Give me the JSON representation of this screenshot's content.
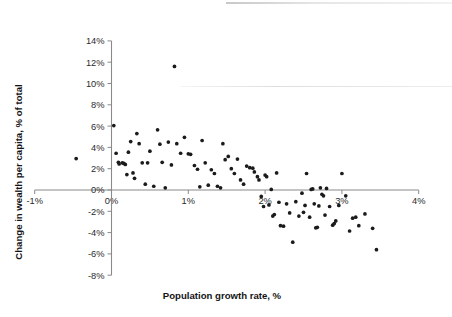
{
  "chart_data": {
    "type": "scatter",
    "title": "",
    "xlabel": "Population growth rate, %",
    "ylabel": "Change in wealth per capita, % of total",
    "xlim": [
      -1,
      4
    ],
    "ylim": [
      -8,
      14
    ],
    "xticks": [
      "-1%",
      "0%",
      "1%",
      "2%",
      "3%",
      "4%"
    ],
    "xtick_values": [
      -1,
      0,
      1,
      2,
      3,
      4
    ],
    "yticks": [
      "14%",
      "12%",
      "10%",
      "8%",
      "6%",
      "4%",
      "2%",
      "0%",
      "-2%",
      "-4%",
      "-6%",
      "-8%"
    ],
    "ytick_values": [
      14,
      12,
      10,
      8,
      6,
      4,
      2,
      0,
      -2,
      -4,
      -6,
      -8
    ],
    "grid": false,
    "legend": "none",
    "marker": "filled-circle",
    "marker_color": "#1b1b1b",
    "axis_color": "#8a8a8a",
    "series": [
      {
        "name": "Countries",
        "points": [
          [
            -0.46,
            2.95
          ],
          [
            0.03,
            6.05
          ],
          [
            0.06,
            3.45
          ],
          [
            0.09,
            2.6
          ],
          [
            0.1,
            2.45
          ],
          [
            0.14,
            2.55
          ],
          [
            0.16,
            2.5
          ],
          [
            0.18,
            2.4
          ],
          [
            0.2,
            1.45
          ],
          [
            0.22,
            3.55
          ],
          [
            0.25,
            4.55
          ],
          [
            0.28,
            1.6
          ],
          [
            0.33,
            5.3
          ],
          [
            0.36,
            4.35
          ],
          [
            0.4,
            2.55
          ],
          [
            0.44,
            0.55
          ],
          [
            0.5,
            3.65
          ],
          [
            0.55,
            0.35
          ],
          [
            0.6,
            5.65
          ],
          [
            0.63,
            4.3
          ],
          [
            0.66,
            2.6
          ],
          [
            0.7,
            0.2
          ],
          [
            0.74,
            4.5
          ],
          [
            0.78,
            2.35
          ],
          [
            0.82,
            11.6
          ],
          [
            0.85,
            4.35
          ],
          [
            0.9,
            3.45
          ],
          [
            0.95,
            4.95
          ],
          [
            1.0,
            3.4
          ],
          [
            1.03,
            3.35
          ],
          [
            1.08,
            2.3
          ],
          [
            1.12,
            1.95
          ],
          [
            1.18,
            4.65
          ],
          [
            1.22,
            2.55
          ],
          [
            1.26,
            0.45
          ],
          [
            1.3,
            1.9
          ],
          [
            1.34,
            1.55
          ],
          [
            1.38,
            0.35
          ],
          [
            1.42,
            0.2
          ],
          [
            1.48,
            2.85
          ],
          [
            1.52,
            3.15
          ],
          [
            1.56,
            2.0
          ],
          [
            1.6,
            1.55
          ],
          [
            1.64,
            2.9
          ],
          [
            1.68,
            0.95
          ],
          [
            1.72,
            0.55
          ],
          [
            1.76,
            2.25
          ],
          [
            1.8,
            2.1
          ],
          [
            1.84,
            2.05
          ],
          [
            1.86,
            1.7
          ],
          [
            1.9,
            1.25
          ],
          [
            1.92,
            0.95
          ],
          [
            1.95,
            -0.6
          ],
          [
            1.98,
            -1.55
          ],
          [
            2.0,
            1.4
          ],
          [
            2.02,
            1.25
          ],
          [
            2.05,
            -1.4
          ],
          [
            2.08,
            0.05
          ],
          [
            2.1,
            -2.45
          ],
          [
            2.12,
            -2.3
          ],
          [
            2.15,
            1.6
          ],
          [
            2.18,
            -1.15
          ],
          [
            2.2,
            -3.35
          ],
          [
            2.24,
            -3.4
          ],
          [
            2.28,
            -1.3
          ],
          [
            2.32,
            -2.15
          ],
          [
            2.36,
            -4.9
          ],
          [
            2.4,
            -1.1
          ],
          [
            2.44,
            -2.45
          ],
          [
            2.48,
            -0.3
          ],
          [
            2.5,
            -2.1
          ],
          [
            2.52,
            -1.45
          ],
          [
            2.54,
            1.55
          ],
          [
            2.58,
            -2.55
          ],
          [
            2.6,
            0.05
          ],
          [
            2.62,
            0.1
          ],
          [
            2.64,
            -1.3
          ],
          [
            2.66,
            -3.55
          ],
          [
            2.68,
            -3.5
          ],
          [
            2.7,
            -1.5
          ],
          [
            2.72,
            0.2
          ],
          [
            2.74,
            -0.4
          ],
          [
            2.76,
            -0.55
          ],
          [
            2.78,
            -2.35
          ],
          [
            2.8,
            0.15
          ],
          [
            2.84,
            -1.55
          ],
          [
            2.88,
            -3.3
          ],
          [
            2.9,
            -3.15
          ],
          [
            2.92,
            -2.9
          ],
          [
            2.96,
            -1.45
          ],
          [
            3.0,
            1.55
          ],
          [
            3.05,
            -0.55
          ],
          [
            3.1,
            -3.85
          ],
          [
            3.14,
            -2.65
          ],
          [
            3.18,
            -2.55
          ],
          [
            3.22,
            -3.35
          ],
          [
            3.3,
            -2.25
          ],
          [
            3.4,
            -3.6
          ],
          [
            3.45,
            -5.6
          ],
          [
            1.45,
            4.35
          ],
          [
            0.47,
            2.55
          ],
          [
            0.3,
            1.1
          ],
          [
            1.15,
            0.3
          ]
        ]
      }
    ]
  }
}
